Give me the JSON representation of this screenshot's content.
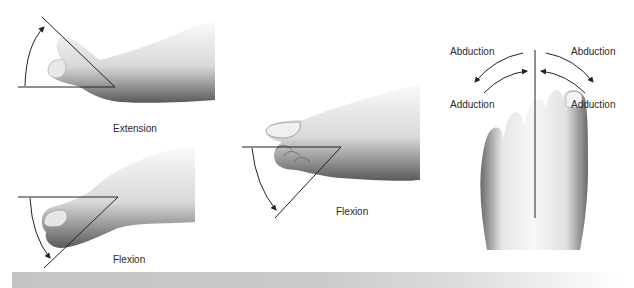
{
  "figure": {
    "panels": [
      {
        "id": "extension",
        "label": "Extension",
        "view": "lateral",
        "motion": "toe extension, arc arrow upward"
      },
      {
        "id": "flexion-lesser",
        "label": "Flexion",
        "view": "lateral",
        "motion": "toe flexion, arc arrow downward"
      },
      {
        "id": "flexion-great",
        "label": "Flexion",
        "view": "lateral",
        "motion": "toe flexion, arc arrow downward"
      },
      {
        "id": "abduction-adduction",
        "view": "dorsal",
        "labels": {
          "left_top": "Abduction",
          "right_top": "Abduction",
          "left_bottom": "Adduction",
          "right_bottom": "Adduction"
        }
      }
    ]
  },
  "colors": {
    "line": "#222222",
    "skin_light": "#f2f2f2",
    "skin_shadow": "#6a6a6a",
    "bar": "#c4c4c4"
  }
}
